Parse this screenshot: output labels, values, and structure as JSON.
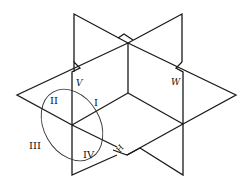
{
  "diagram": {
    "type": "three-projection-planes",
    "planes": [
      {
        "name": "V",
        "label": "V"
      },
      {
        "name": "H",
        "label": "H"
      },
      {
        "name": "W",
        "label": "W"
      }
    ],
    "quadrants": [
      {
        "label": "I"
      },
      {
        "label": "II"
      },
      {
        "label": "III"
      },
      {
        "label": "IV"
      }
    ],
    "colors": {
      "line": "#1a1a1a",
      "background": "#ffffff"
    }
  }
}
